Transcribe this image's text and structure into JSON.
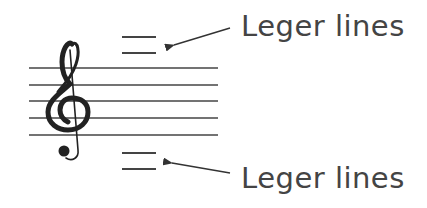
{
  "diagram": {
    "labels": {
      "top": "Leger lines",
      "bottom": "Leger lines"
    },
    "staff": {
      "line_count": 5,
      "clef": "treble-clef",
      "clef_glyph": "𝄞"
    },
    "colors": {
      "ink": "#333333",
      "text": "#444444",
      "background": "#ffffff"
    }
  }
}
